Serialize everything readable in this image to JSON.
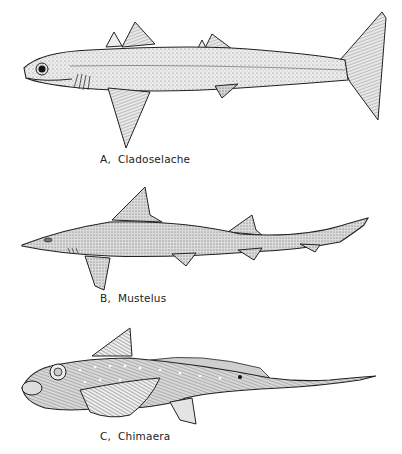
{
  "figure": {
    "panels": [
      {
        "letter": "A,",
        "name": "Cladoselache"
      },
      {
        "letter": "B,",
        "name": "Mustelus"
      },
      {
        "letter": "C,",
        "name": "Chimaera"
      }
    ],
    "colors": {
      "ink": "#222222",
      "fill": "#e4e4e4",
      "shade": "#b8b8b8",
      "background": "#ffffff"
    }
  }
}
